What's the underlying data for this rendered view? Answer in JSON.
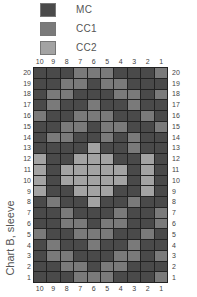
{
  "legend": [
    {
      "label": "MC",
      "color": "#4a4a4a",
      "key": "D"
    },
    {
      "label": "CC1",
      "color": "#7a7a7a",
      "key": "C"
    },
    {
      "label": "CC2",
      "color": "#a3a3a3",
      "key": "L"
    }
  ],
  "side_title": "Chart B, sleeve",
  "chart_data": {
    "type": "heatmap",
    "title": "Chart B, sleeve",
    "x_labels": [
      "10",
      "9",
      "8",
      "7",
      "6",
      "5",
      "4",
      "3",
      "2",
      "1"
    ],
    "y_labels": [
      "20",
      "19",
      "18",
      "17",
      "16",
      "15",
      "14",
      "13",
      "12",
      "11",
      "10",
      "9",
      "8",
      "7",
      "6",
      "5",
      "4",
      "3",
      "2",
      "1"
    ],
    "legend": {
      "D": "MC",
      "C": "CC1",
      "L": "CC2"
    },
    "rows": [
      [
        "D",
        "D",
        "D",
        "C",
        "C",
        "C",
        "D",
        "D",
        "D",
        "C"
      ],
      [
        "D",
        "D",
        "C",
        "C",
        "D",
        "C",
        "C",
        "D",
        "D",
        "D"
      ],
      [
        "D",
        "C",
        "C",
        "D",
        "D",
        "D",
        "C",
        "C",
        "D",
        "C"
      ],
      [
        "D",
        "C",
        "D",
        "D",
        "C",
        "D",
        "D",
        "C",
        "D",
        "D"
      ],
      [
        "C",
        "D",
        "D",
        "C",
        "C",
        "C",
        "D",
        "D",
        "C",
        "D"
      ],
      [
        "D",
        "D",
        "C",
        "C",
        "D",
        "C",
        "C",
        "D",
        "D",
        "C"
      ],
      [
        "D",
        "C",
        "C",
        "D",
        "D",
        "C",
        "D",
        "C",
        "D",
        "D"
      ],
      [
        "D",
        "D",
        "D",
        "D",
        "L",
        "D",
        "D",
        "C",
        "D",
        "D"
      ],
      [
        "L",
        "D",
        "D",
        "L",
        "L",
        "L",
        "D",
        "D",
        "L",
        "D"
      ],
      [
        "L",
        "D",
        "L",
        "L",
        "L",
        "L",
        "L",
        "D",
        "L",
        "D"
      ],
      [
        "L",
        "D",
        "L",
        "L",
        "L",
        "L",
        "L",
        "D",
        "L",
        "D"
      ],
      [
        "L",
        "D",
        "D",
        "L",
        "L",
        "L",
        "D",
        "D",
        "L",
        "D"
      ],
      [
        "D",
        "C",
        "D",
        "D",
        "L",
        "D",
        "D",
        "C",
        "D",
        "D"
      ],
      [
        "D",
        "D",
        "C",
        "D",
        "D",
        "D",
        "C",
        "D",
        "D",
        "C"
      ],
      [
        "D",
        "D",
        "C",
        "C",
        "D",
        "C",
        "C",
        "D",
        "D",
        "C"
      ],
      [
        "C",
        "D",
        "D",
        "C",
        "C",
        "C",
        "D",
        "D",
        "C",
        "D"
      ],
      [
        "D",
        "C",
        "D",
        "D",
        "C",
        "D",
        "D",
        "C",
        "D",
        "D"
      ],
      [
        "D",
        "C",
        "C",
        "D",
        "D",
        "D",
        "C",
        "C",
        "D",
        "C"
      ],
      [
        "D",
        "D",
        "C",
        "C",
        "D",
        "C",
        "C",
        "D",
        "D",
        "D"
      ],
      [
        "D",
        "D",
        "D",
        "C",
        "C",
        "C",
        "D",
        "D",
        "D",
        "C"
      ]
    ]
  }
}
